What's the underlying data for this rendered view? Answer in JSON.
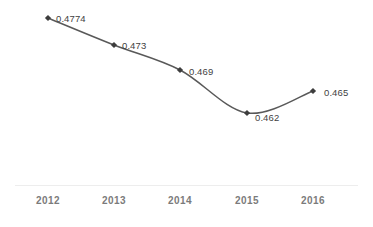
{
  "chart_data": {
    "type": "line",
    "title": "",
    "subtitle": "",
    "xlabel": "",
    "ylabel": "",
    "categories": [
      "2012",
      "2013",
      "2014",
      "2015",
      "2016"
    ],
    "values": [
      0.4774,
      0.473,
      0.469,
      0.462,
      0.465
    ],
    "point_labels": [
      "0.4774",
      "0.473",
      "0.469",
      "0.462",
      "0.465"
    ],
    "series": [
      {
        "name": "",
        "values": [
          0.4774,
          0.473,
          0.469,
          0.462,
          0.465
        ]
      }
    ],
    "ylim": [
      0.4585,
      0.4795
    ],
    "grid": false,
    "legend": false,
    "legend_position": "none",
    "y_axis_visible": false,
    "x_axis_visible": true,
    "marker": "diamond",
    "smoothed": true,
    "colors": {
      "line": "#595959",
      "marker": "#3d3d3d",
      "data_label_text": "#3f3f3f",
      "tick_label_text": "#7b7b7b",
      "axis_line": "#ededed",
      "background": "#ffffff"
    }
  },
  "axis": {
    "ticks": [
      {
        "label": "2012",
        "x": 48
      },
      {
        "label": "2013",
        "x": 114
      },
      {
        "label": "2014",
        "x": 180
      },
      {
        "label": "2015",
        "x": 247
      },
      {
        "label": "2016",
        "x": 313
      }
    ]
  },
  "points": [
    {
      "label": "0.4774",
      "cx": 48,
      "cy": 18,
      "label_x": 56,
      "label_y": 14
    },
    {
      "label": "0.473",
      "cx": 114,
      "cy": 45,
      "label_x": 122,
      "label_y": 41
    },
    {
      "label": "0.469",
      "cx": 180,
      "cy": 70,
      "label_x": 189,
      "label_y": 67
    },
    {
      "label": "0.462",
      "cx": 247,
      "cy": 113,
      "label_x": 255,
      "label_y": 113
    },
    {
      "label": "0.465",
      "cx": 313,
      "cy": 91,
      "label_x": 324,
      "label_y": 88
    }
  ]
}
